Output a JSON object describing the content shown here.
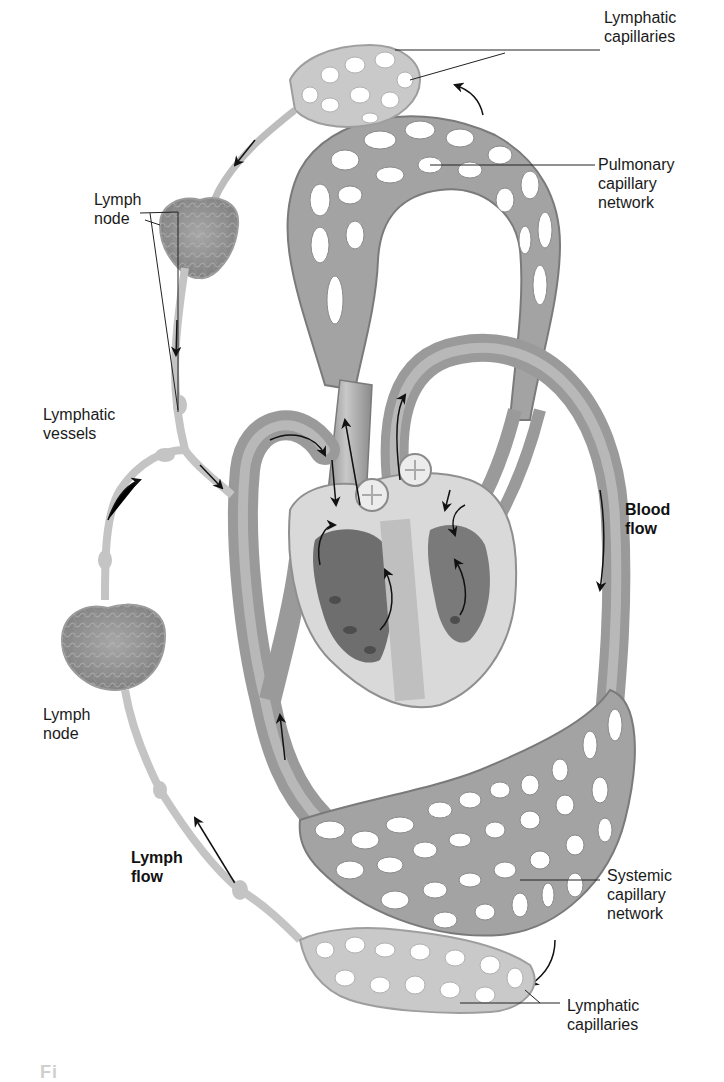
{
  "figure": {
    "colors": {
      "background": "#ffffff",
      "blood_vessel": "#9a9a9a",
      "blood_vessel_highlight": "#c4c4c4",
      "lymph_vessel": "#bdbdbd",
      "lymph_node": "#8f8f8f",
      "heart_wall": "#d6d6d6",
      "heart_chamber": "#6e6e6e",
      "arrow": "#111111",
      "label_text": "#1a1a1a"
    },
    "labels": {
      "lymphatic_capillaries_top": "Lymphatic\ncapillaries",
      "pulmonary_capillary_network": "Pulmonary\ncapillary\nnetwork",
      "lymph_node_top": "Lymph\nnode",
      "lymphatic_vessels": "Lymphatic\nvessels",
      "blood_flow": "Blood\nflow",
      "lymph_node_bottom": "Lymph\nnode",
      "lymph_flow": "Lymph\nflow",
      "systemic_capillary_network": "Systemic\ncapillary\nnetwork",
      "lymphatic_capillaries_bottom": "Lymphatic\ncapillaries"
    },
    "caption_partial": "Fi"
  }
}
